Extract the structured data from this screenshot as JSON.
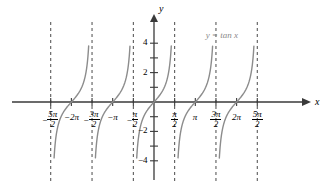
{
  "figure": {
    "curve_label": "y = tan x",
    "axis_x_label": "x",
    "axis_y_label": "y",
    "colors": {
      "curve": "#8c8c8c",
      "axis": "#3a3a3a",
      "asymptote": "#4a4a4a",
      "text": "#000000",
      "equation_text": "#8a8a8a",
      "background": "#ffffff"
    }
  },
  "chart_data": {
    "type": "line",
    "title": "",
    "subtitle": "",
    "xlabel": "x",
    "ylabel": "y",
    "function": "y = tan x",
    "xlim": [
      -8.639,
      9.0
    ],
    "ylim": [
      -4.8,
      4.8
    ],
    "grid": false,
    "legend": "none",
    "annotations": [
      {
        "text": "y = tan x",
        "x": 5.6,
        "y": 4.55
      }
    ],
    "x_ticks": [
      {
        "value": -7.854,
        "label": "-5π/2",
        "num": "5π",
        "den": "2",
        "sign": "−",
        "style": "fraction"
      },
      {
        "value": -6.283,
        "label": "-2π",
        "text": "−2π",
        "style": "plain"
      },
      {
        "value": -4.712,
        "label": "-3π/2",
        "num": "3π",
        "den": "2",
        "sign": "−",
        "style": "fraction"
      },
      {
        "value": -3.142,
        "label": "-π",
        "text": "−π",
        "style": "plain"
      },
      {
        "value": -1.571,
        "label": "-π/2",
        "num": "π",
        "den": "2",
        "sign": "−",
        "style": "fraction"
      },
      {
        "value": 1.571,
        "label": "π/2",
        "num": "π",
        "den": "2",
        "sign": "",
        "style": "fraction"
      },
      {
        "value": 3.142,
        "label": "π",
        "text": "π",
        "style": "plain"
      },
      {
        "value": 4.712,
        "label": "3π/2",
        "num": "3π",
        "den": "2",
        "sign": "",
        "style": "fraction"
      },
      {
        "value": 6.283,
        "label": "2π",
        "text": "2π",
        "style": "plain"
      },
      {
        "value": 7.854,
        "label": "5π/2",
        "num": "5π",
        "den": "2",
        "sign": "",
        "style": "fraction"
      }
    ],
    "y_ticks": [
      {
        "value": 4,
        "label": "4"
      },
      {
        "value": 3,
        "label": ""
      },
      {
        "value": 2,
        "label": "2"
      },
      {
        "value": 1,
        "label": ""
      },
      {
        "value": -1,
        "label": ""
      },
      {
        "value": -2,
        "label": "−2"
      },
      {
        "value": -3,
        "label": ""
      },
      {
        "value": -4,
        "label": "−4"
      }
    ],
    "asymptotes": [
      -7.854,
      -4.712,
      -1.571,
      1.571,
      4.712,
      7.854
    ],
    "zero_crossings": [
      -6.283,
      -3.142,
      0,
      3.142,
      6.283
    ],
    "branches": [
      {
        "center": -6.283,
        "x_range": [
          -7.854,
          -4.712
        ],
        "y_clip": [
          -4,
          4
        ]
      },
      {
        "center": -3.142,
        "x_range": [
          -4.712,
          -1.571
        ],
        "y_clip": [
          -4,
          4
        ]
      },
      {
        "center": 0,
        "x_range": [
          -1.571,
          1.571
        ],
        "y_clip": [
          -4,
          4
        ]
      },
      {
        "center": 3.142,
        "x_range": [
          1.571,
          4.712
        ],
        "y_clip": [
          -4,
          4
        ]
      },
      {
        "center": 6.283,
        "x_range": [
          4.712,
          7.854
        ],
        "y_clip": [
          -4,
          4
        ]
      }
    ]
  }
}
